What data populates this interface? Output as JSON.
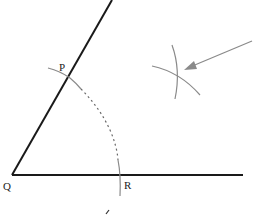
{
  "diagram": {
    "colors": {
      "ray": "#1a1a1a",
      "arc": "#8a8a8a",
      "arrow": "#8a8a8a",
      "label": "#222222",
      "background": "#ffffff"
    },
    "points": {
      "Q": {
        "label": "Q",
        "x": 12,
        "y": 175
      },
      "P": {
        "label": "P",
        "x": 67,
        "y": 78
      },
      "R": {
        "label": "R",
        "x": 121,
        "y": 175
      }
    },
    "rays": [
      {
        "name": "ray-QP",
        "from": [
          12,
          175
        ],
        "to": [
          112,
          0
        ]
      },
      {
        "name": "ray-QR",
        "from": [
          12,
          175
        ],
        "to": [
          243,
          175
        ]
      }
    ],
    "arcs": [
      {
        "name": "arc-centered-Q",
        "center": "Q",
        "style": "solid-dashed-solid"
      },
      {
        "name": "arc-from-P",
        "style": "solid"
      },
      {
        "name": "arc-from-R",
        "style": "solid"
      }
    ],
    "arrow": {
      "from": [
        252,
        41
      ],
      "to": [
        184,
        70
      ],
      "points_to": "arc-intersection"
    },
    "mark": {
      "x": 108,
      "y": 212
    }
  }
}
